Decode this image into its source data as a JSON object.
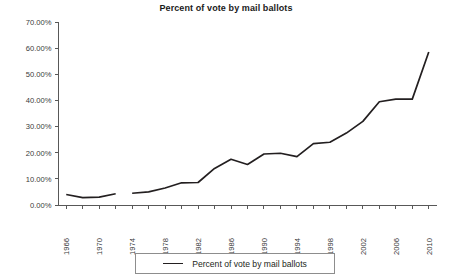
{
  "chart_data": {
    "type": "line",
    "title": "Percent of vote by mail ballots",
    "xlabel": "",
    "ylabel": "",
    "xlim": [
      1965,
      2011
    ],
    "ylim": [
      0,
      70
    ],
    "grid": false,
    "legend_position": "bottom",
    "y_tick_labels": [
      "70.00%",
      "60.00%",
      "50.00%",
      "40.00%",
      "30.00%",
      "20.00%",
      "10.00%",
      "0.00%"
    ],
    "y_tick_values": [
      70,
      60,
      50,
      40,
      30,
      20,
      10,
      0
    ],
    "x_tick_labels": [
      "1966",
      "1970",
      "1974",
      "1978",
      "1982",
      "1986",
      "1990",
      "1994",
      "1998",
      "2002",
      "2006",
      "2010"
    ],
    "x_tick_values": [
      1966,
      1970,
      1974,
      1978,
      1982,
      1986,
      1990,
      1994,
      1998,
      2002,
      2006,
      2010
    ],
    "x_minor_ticks": [
      1968,
      1972,
      1976,
      1980,
      1984,
      1988,
      1992,
      1996,
      2000,
      2004,
      2008
    ],
    "series": [
      {
        "name": "Percent of vote by mail ballots",
        "color": "#231f20",
        "segments": [
          {
            "x": [
              1966,
              1968,
              1970,
              1972
            ],
            "values": [
              4.0,
              2.8,
              3.0,
              4.3
            ]
          },
          {
            "x": [
              1974,
              1976,
              1978,
              1980,
              1982,
              1984,
              1986,
              1988,
              1990,
              1992,
              1994,
              1996,
              1998,
              2000,
              2002,
              2004,
              2006,
              2008,
              2010
            ],
            "values": [
              4.5,
              5.0,
              6.5,
              8.5,
              8.6,
              14.0,
              17.5,
              15.5,
              19.5,
              19.8,
              18.5,
              23.5,
              24.0,
              27.5,
              32.0,
              39.5,
              40.5,
              40.5,
              58.5
            ]
          }
        ]
      }
    ]
  },
  "legend": {
    "entries": [
      {
        "label": "Percent of vote by mail ballots",
        "swatch": "line-swatch"
      }
    ]
  }
}
